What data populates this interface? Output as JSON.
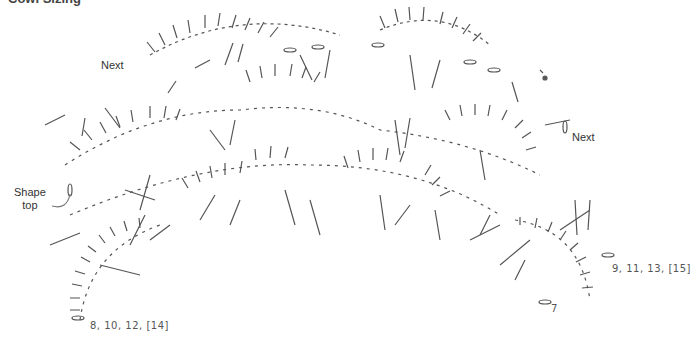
{
  "header": {
    "clipped_title": "Cowl Sizing"
  },
  "labels": {
    "next_left": "Next",
    "next_right": "Next",
    "shape_top": "Shape\ntop",
    "shape_top_line1": "Shape",
    "shape_top_line2": "top",
    "rows_left": "8, 10, 12, [14]",
    "rows_right": "9, 11, 13, [15]",
    "row_7": "7"
  },
  "colors": {
    "stroke": "#555555",
    "text": "#333333",
    "background": "#ffffff"
  },
  "diagram": {
    "type": "crochet stitch chart",
    "symbols": [
      "double-crochet",
      "chain",
      "shell-arc"
    ],
    "arcs": [
      {
        "row": "top-left",
        "cx": 250,
        "cy": 120,
        "r": 95
      },
      {
        "row": "top-right",
        "cx": 455,
        "cy": 110,
        "r": 80
      },
      {
        "row": "middle",
        "cx": 300,
        "cy": 200,
        "r": 120
      },
      {
        "row": "lower",
        "cx": 300,
        "cy": 260,
        "r": 150
      }
    ]
  }
}
